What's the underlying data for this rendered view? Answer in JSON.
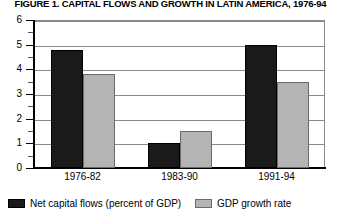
{
  "chart_data": {
    "type": "bar",
    "title": "FIGURE 1. CAPITAL FLOWS AND GROWTH IN LATIN AMERICA, 1976-94",
    "xlabel": "",
    "ylabel": "",
    "categories": [
      "1976-82",
      "1983-90",
      "1991-94"
    ],
    "series": [
      {
        "name": "Net capital flows (percent of GDP)",
        "color": "#1a1a1a",
        "values": [
          4.8,
          1.0,
          5.0
        ]
      },
      {
        "name": "GDP growth rate",
        "color": "#b4b4b4",
        "values": [
          3.8,
          1.5,
          3.5
        ]
      }
    ],
    "ylim": [
      0,
      6
    ],
    "yticks": [
      0,
      1,
      2,
      3,
      4,
      5,
      6
    ],
    "ytick_labels": [
      "0",
      "1",
      "2",
      "3",
      "4",
      "5",
      "6"
    ],
    "yminor_ticks": [
      0.5,
      1.5,
      2.5,
      3.5,
      4.5,
      5.5
    ],
    "grid": true,
    "grid_axis": "y",
    "legend_position": "bottom"
  },
  "legend": {
    "items": [
      {
        "label": "Net capital flows (percent of GDP)",
        "swatch": "dark"
      },
      {
        "label": "GDP growth rate",
        "swatch": "gray"
      }
    ]
  }
}
